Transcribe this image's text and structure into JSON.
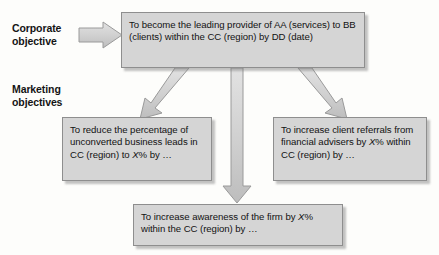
{
  "diagram": {
    "background_color": "#fdfdfb",
    "box_fill_color": "#d5d5d5",
    "box_border_color": "#8e8e8e",
    "arrow_fill_color": "#cccccc",
    "arrow_border_color": "#9a9a9a",
    "text_color": "#121212"
  },
  "labels": {
    "corporate": "Corporate\nobjective",
    "corporate_line1": "Corporate",
    "corporate_line2": "objective",
    "marketing": "Marketing\nobjectives",
    "marketing_line1": "Marketing",
    "marketing_line2": "objectives"
  },
  "nodes": {
    "corporate_objective": {
      "id": "corporate-objective",
      "text": "To become the leading provider of AA (services) to BB (clients) within the CC (region) by DD (date)",
      "level": "corporate"
    },
    "reduce_unconverted": {
      "id": "marketing-objective-reduce-unconverted-leads",
      "text_part1": "To reduce the percentage of unconverted business leads in CC (region) to ",
      "text_italic": "X",
      "text_part2": "% by …",
      "text": "To reduce the percentage of unconverted business leads in CC (region) to X% by …",
      "level": "marketing"
    },
    "increase_referrals": {
      "id": "marketing-objective-increase-client-referrals",
      "text_part1": "To increase client referrals from financial advisers by ",
      "text_italic": "X",
      "text_part2": "% within CC (region) by …",
      "text": "To increase client referrals from financial advisers by X% within CC (region) by …",
      "level": "marketing"
    },
    "increase_awareness": {
      "id": "marketing-objective-increase-awareness",
      "text_part1": "To increase awareness of the firm by ",
      "text_italic": "X",
      "text_part2": "% within the CC (region) by …",
      "text": "To increase awareness of the firm by X% within the CC (region) by …",
      "level": "marketing"
    }
  },
  "arrows": [
    {
      "id": "arrow-corporate-label-to-box",
      "direction": "right",
      "from": "corporate-label",
      "to": "corporate-objective"
    },
    {
      "id": "arrow-corporate-to-reduce",
      "direction": "down-left",
      "from": "corporate-objective",
      "to": "marketing-objective-reduce-unconverted-leads"
    },
    {
      "id": "arrow-corporate-to-awareness",
      "direction": "down",
      "from": "corporate-objective",
      "to": "marketing-objective-increase-awareness"
    },
    {
      "id": "arrow-corporate-to-referrals",
      "direction": "down-right",
      "from": "corporate-objective",
      "to": "marketing-objective-increase-client-referrals"
    }
  ]
}
